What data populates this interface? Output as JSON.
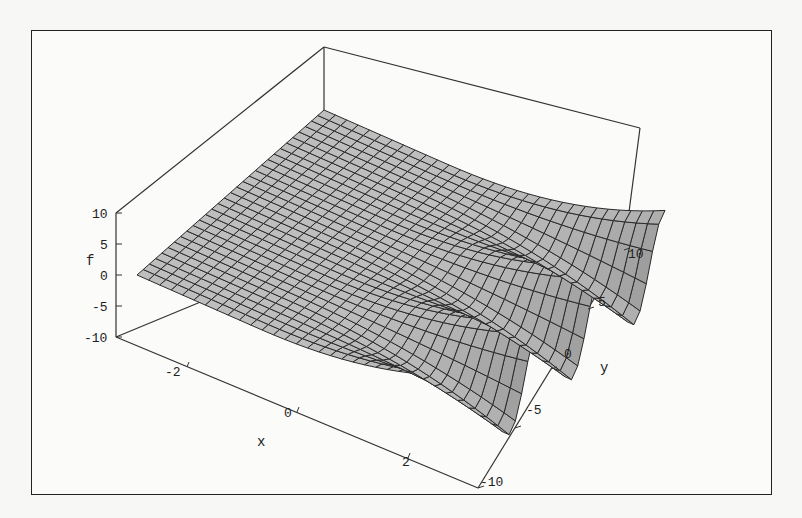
{
  "chart_data": {
    "type": "surface3d",
    "title": "",
    "xlabel": "x",
    "ylabel": "y",
    "zlabel": "f",
    "x_range": [
      -3,
      3
    ],
    "y_range": [
      -10,
      10
    ],
    "z_range": [
      -10,
      10
    ],
    "x_ticks": [
      "-2",
      "0",
      "2"
    ],
    "y_ticks": [
      "-10",
      "-5",
      "0",
      "5",
      "10"
    ],
    "z_ticks": [
      "10",
      "5",
      "0",
      "-5",
      "-10"
    ],
    "surface_color": "#b4b4b4",
    "mesh_color": "#2a2a2a",
    "grid": false
  },
  "labels": {
    "z_axis": "f",
    "x_axis": "x",
    "y_axis": "y",
    "z_ticks": [
      "10",
      "5",
      "0",
      "-5",
      "-10"
    ],
    "x_ticks": [
      "-2",
      "0",
      "2"
    ],
    "y_ticks": [
      "10",
      "5",
      "0",
      "-5",
      "-10"
    ]
  }
}
